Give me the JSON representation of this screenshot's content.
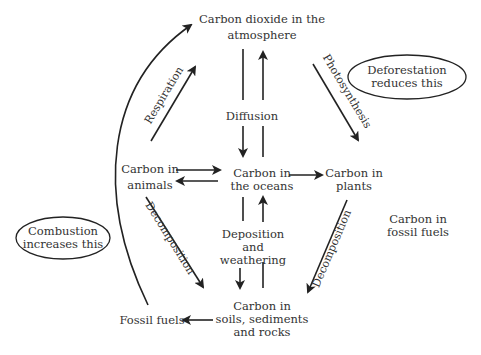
{
  "diagram": {
    "nodes": {
      "atmosphere": [
        "Carbon dioxide in the",
        "atmosphere"
      ],
      "animals": [
        "Carbon in",
        "animals"
      ],
      "oceans": [
        "Carbon in",
        "the oceans"
      ],
      "plants": [
        "Carbon in",
        "plants"
      ],
      "fossil_fuels_store": [
        "Carbon in",
        "fossil fuels"
      ],
      "soils": [
        "Carbon in",
        "soils, sediments",
        "and rocks"
      ],
      "fossil_fuels": "Fossil fuels"
    },
    "process_labels": {
      "respiration": "Respiration",
      "photosynthesis": "Photosynthesis",
      "diffusion": "Diffusion",
      "decomposition_animals": "Decomposition",
      "decomposition_plants": "Decomposition",
      "deposition": [
        "Deposition",
        "and",
        "weathering"
      ]
    },
    "callouts": {
      "deforestation": [
        "Deforestation",
        "reduces this"
      ],
      "combustion": [
        "Combustion",
        "increases this"
      ]
    },
    "edges": [
      {
        "from": "animals",
        "to": "atmosphere",
        "label": "Respiration"
      },
      {
        "from": "atmosphere",
        "to": "plants",
        "label": "Photosynthesis"
      },
      {
        "from": "atmosphere",
        "to": "oceans",
        "label": "Diffusion"
      },
      {
        "from": "oceans",
        "to": "atmosphere",
        "label": "Diffusion"
      },
      {
        "from": "animals",
        "to": "oceans",
        "label": ""
      },
      {
        "from": "oceans",
        "to": "animals",
        "label": ""
      },
      {
        "from": "oceans",
        "to": "plants",
        "label": ""
      },
      {
        "from": "animals",
        "to": "soils",
        "label": "Decomposition"
      },
      {
        "from": "plants",
        "to": "soils",
        "label": "Decomposition"
      },
      {
        "from": "oceans",
        "to": "soils",
        "label": "Deposition and weathering"
      },
      {
        "from": "soils",
        "to": "oceans",
        "label": "Deposition and weathering"
      },
      {
        "from": "soils",
        "to": "fossil_fuels",
        "label": ""
      },
      {
        "from": "fossil_fuels",
        "to": "atmosphere",
        "label": ""
      }
    ]
  }
}
